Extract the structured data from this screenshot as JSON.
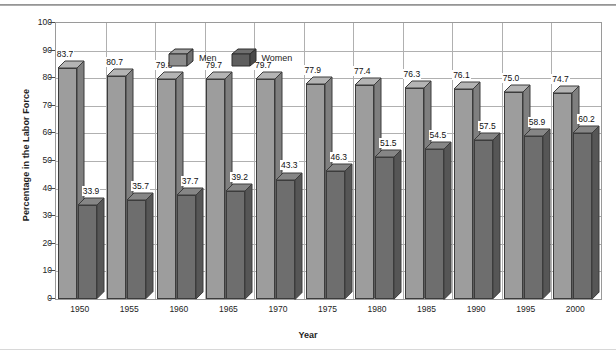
{
  "chart_data": {
    "type": "bar",
    "title": "",
    "xlabel": "Year",
    "ylabel": "Percentage in the Labor Force",
    "categories": [
      "1950",
      "1955",
      "1960",
      "1965",
      "1970",
      "1975",
      "1980",
      "1985",
      "1990",
      "1995",
      "2000"
    ],
    "series": [
      {
        "name": "Men",
        "color": "#9d9d9d",
        "values": [
          83.7,
          80.7,
          79.8,
          79.7,
          79.7,
          77.9,
          77.4,
          76.3,
          76.1,
          75.0,
          74.7
        ],
        "labels": [
          "83.7",
          "80.7",
          "79.8",
          "79.7",
          "79.7",
          "77.9",
          "77.4",
          "76.3",
          "76.1",
          "75.0",
          "74.7"
        ]
      },
      {
        "name": "Women",
        "color": "#6e6e6e",
        "values": [
          33.9,
          35.7,
          37.7,
          39.2,
          43.3,
          46.3,
          51.5,
          54.5,
          57.5,
          58.9,
          60.2
        ],
        "labels": [
          "33.9",
          "35.7",
          "37.7",
          "39.2",
          "43.3",
          "46.3",
          "51.5",
          "54.5",
          "57.5",
          "58.9",
          "60.2"
        ]
      }
    ],
    "ylim": [
      0,
      100
    ],
    "yticks": [
      0,
      10,
      20,
      30,
      40,
      50,
      60,
      70,
      80,
      90,
      100
    ],
    "ytick_labels": [
      "0",
      "10",
      "20",
      "30",
      "40",
      "50",
      "60",
      "70",
      "80",
      "90",
      "100"
    ],
    "grid": true,
    "legend_position": "top-left-inside",
    "style": "3d-column"
  },
  "legend": {
    "items": [
      {
        "label": "Men",
        "swatch": "men-cube-swatch"
      },
      {
        "label": "Women",
        "swatch": "women-cube-swatch"
      }
    ]
  },
  "axis": {
    "x_title": "Year",
    "y_title": "Percentage in the Labor Force"
  }
}
